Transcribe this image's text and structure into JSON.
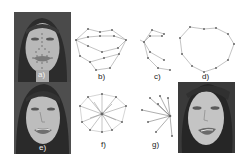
{
  "figure": {
    "panels": [
      {
        "id": "a",
        "label": "a)",
        "kind": "photo-with-landmarks",
        "description": "face photo with landmark points"
      },
      {
        "id": "b",
        "label": "b)",
        "kind": "landmark-graph",
        "description": "mouth contour graph (outer and inner lip points)"
      },
      {
        "id": "c",
        "label": "c)",
        "kind": "landmark-graph",
        "description": "partial mouth graph connected from left corner"
      },
      {
        "id": "d",
        "label": "d)",
        "kind": "landmark-graph",
        "description": "outer lip contour polygon"
      },
      {
        "id": "e",
        "label": "e)",
        "kind": "photo",
        "description": "face photo"
      },
      {
        "id": "f",
        "label": "f)",
        "kind": "landmark-graph",
        "description": "star graph connecting contour points to center"
      },
      {
        "id": "g",
        "label": "g)",
        "kind": "landmark-graph",
        "description": "fan graph connecting points to right corner"
      },
      {
        "id": "h",
        "label": "",
        "kind": "photo",
        "description": "face photo"
      }
    ]
  }
}
